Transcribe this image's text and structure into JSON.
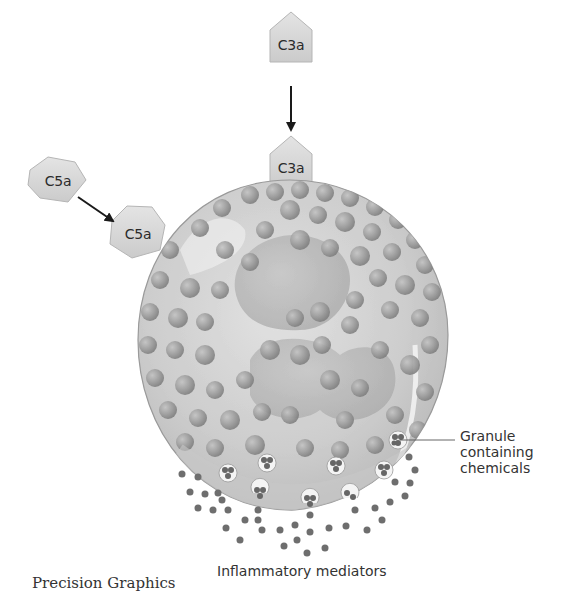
{
  "figure": {
    "credit": "Precision Graphics"
  },
  "molecules": {
    "c3a_free": "C3a",
    "c3a_bound": "C3a",
    "c5a_free": "C5a",
    "c5a_bound": "C5a"
  },
  "labels": {
    "granule": [
      "Granule",
      "containing",
      "chemicals"
    ],
    "mediators": "Inflammatory mediators"
  },
  "colors": {
    "background": "#ffffff",
    "molecule_fill": "#d6d6d6",
    "molecule_stroke": "#b8b8b8",
    "cell_fill": "#cfcfcf",
    "cell_stroke": "#9a9a9a",
    "granule": "#8c8c8c",
    "mediator_dot": "#6e6e6e",
    "arrow": "#1a1a1a",
    "text": "#333333"
  }
}
